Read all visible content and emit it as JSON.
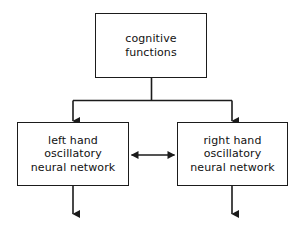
{
  "diagram": {
    "type": "block-diagram",
    "background_color": "#ffffff",
    "line_color": "#1b1b1b",
    "text_color": "#111111",
    "nodes": [
      {
        "id": "cognitive-functions",
        "label": "cognitive\nfunctions",
        "lines": [
          "cognitive",
          "functions"
        ]
      },
      {
        "id": "left-hand-network",
        "label": "left hand\noscillatory\nneural network",
        "lines": [
          "left hand",
          "oscillatory",
          "neural network"
        ]
      },
      {
        "id": "right-hand-network",
        "label": "right hand\noscillatory\nneural network",
        "lines": [
          "right hand",
          "oscillatory",
          "neural network"
        ]
      }
    ],
    "edges": [
      {
        "id": "cognitive-to-left",
        "from": "cognitive-functions",
        "to": "left-hand-network",
        "style": "elbow",
        "arrowheads": "end"
      },
      {
        "id": "cognitive-to-right",
        "from": "cognitive-functions",
        "to": "right-hand-network",
        "style": "elbow",
        "arrowheads": "end"
      },
      {
        "id": "left-right-coupling",
        "from": "left-hand-network",
        "to": "right-hand-network",
        "style": "straight",
        "arrowheads": "both"
      },
      {
        "id": "left-output",
        "from": "left-hand-network",
        "to": "",
        "style": "straight",
        "arrowheads": "end"
      },
      {
        "id": "right-output",
        "from": "right-hand-network",
        "to": "",
        "style": "straight",
        "arrowheads": "end"
      }
    ]
  }
}
